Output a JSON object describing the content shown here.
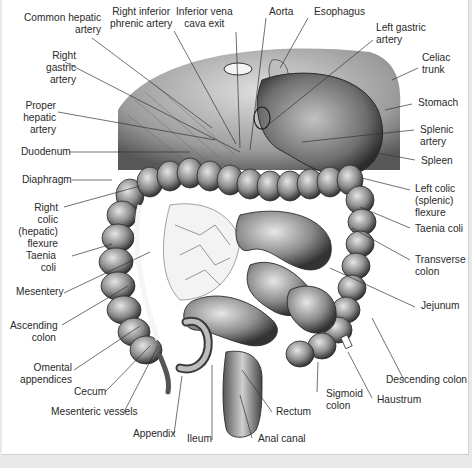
{
  "figure": {
    "background": "#ffffff",
    "ink": "#2a2a2a"
  },
  "labels": {
    "common_hepatic_artery": "Common hepatic\nartery",
    "right_inferior_phrenic_artery": "Right inferior\nphrenic artery",
    "inferior_vena_cava_exit": "Inferior vena\ncava exit",
    "aorta": "Aorta",
    "esophagus": "Esophagus",
    "left_gastric_artery": "Left gastric\nartery",
    "celiac_trunk": "Celiac\ntrunk",
    "right_gastric_artery": "Right\ngastric\nartery",
    "stomach": "Stomach",
    "proper_hepatic_artery": "Proper\nhepatic\nartery",
    "splenic_artery": "Splenic\nartery",
    "duodenum": "Duodenum",
    "spleen": "Spleen",
    "diaphragm": "Diaphragm",
    "left_colic_flexure": "Left colic\n(splenic)\nflexure",
    "right_colic_flexure": "Right colic\n(hepatic)\nflexure",
    "taenia_coli_right": "Taenia coli",
    "taenia_coli_left": "Taenia\ncoli",
    "transverse_colon": "Transverse\ncolon",
    "mesentery": "Mesentery",
    "jejunum": "Jejunum",
    "ascending_colon": "Ascending\ncolon",
    "omental_appendices": "Omental\nappendices",
    "descending_colon": "Descending colon",
    "cecum": "Cecum",
    "haustrum": "Haustrum",
    "sigmoid_colon": "Sigmoid\ncolon",
    "mesenteric_vessels": "Mesenteric vessels",
    "rectum": "Rectum",
    "appendix": "Appendix",
    "ileum": "Ileum",
    "anal_canal": "Anal canal"
  }
}
